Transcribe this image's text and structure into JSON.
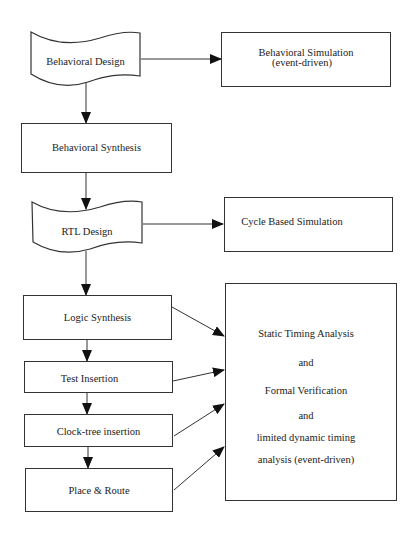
{
  "diagram": {
    "title": "",
    "nodes": [
      {
        "id": "behavioral_design",
        "label": "Behavioral Design",
        "shape": "document"
      },
      {
        "id": "behavioral_simulation",
        "label": "Behavioral Simulation",
        "label2": "(event-driven)",
        "shape": "rect"
      },
      {
        "id": "behavioral_synthesis",
        "label": "Behavioral Synthesis",
        "shape": "rect"
      },
      {
        "id": "rtl_design",
        "label": "RTL Design",
        "shape": "document"
      },
      {
        "id": "cycle_based_simulation",
        "label": "Cycle Based Simulation",
        "shape": "rect"
      },
      {
        "id": "logic_synthesis",
        "label": "Logic Synthesis",
        "shape": "rect"
      },
      {
        "id": "test_insertion",
        "label": "Test Insertion",
        "shape": "rect"
      },
      {
        "id": "clock_tree_insertion",
        "label": "Clock-tree insertion",
        "shape": "rect"
      },
      {
        "id": "place_route",
        "label": "Place & Route",
        "shape": "rect"
      },
      {
        "id": "verification",
        "shape": "rect",
        "lines": [
          "Static Timing Analysis",
          "and",
          "Formal Verification",
          "and",
          "limited dynamic timing",
          "analysis (event-driven)"
        ]
      }
    ],
    "edges": [
      {
        "from": "behavioral_design",
        "to": "behavioral_simulation"
      },
      {
        "from": "behavioral_design",
        "to": "behavioral_synthesis"
      },
      {
        "from": "behavioral_synthesis",
        "to": "rtl_design"
      },
      {
        "from": "rtl_design",
        "to": "cycle_based_simulation"
      },
      {
        "from": "rtl_design",
        "to": "logic_synthesis"
      },
      {
        "from": "logic_synthesis",
        "to": "test_insertion"
      },
      {
        "from": "test_insertion",
        "to": "clock_tree_insertion"
      },
      {
        "from": "clock_tree_insertion",
        "to": "place_route"
      },
      {
        "from": "logic_synthesis",
        "to": "verification"
      },
      {
        "from": "test_insertion",
        "to": "verification"
      },
      {
        "from": "clock_tree_insertion",
        "to": "verification"
      },
      {
        "from": "place_route",
        "to": "verification"
      }
    ]
  },
  "labels": {
    "behavioral_design": "Behavioral Design",
    "behavioral_simulation_1": "Behavioral Simulation",
    "behavioral_simulation_2": "(event-driven)",
    "behavioral_synthesis": "Behavioral Synthesis",
    "rtl_design": "RTL Design",
    "cycle_based_simulation": "Cycle Based Simulation",
    "logic_synthesis": "Logic Synthesis",
    "test_insertion": "Test Insertion",
    "clock_tree_insertion": "Clock-tree insertion",
    "place_route": "Place & Route",
    "verification": [
      "Static Timing Analysis",
      "and",
      "Formal Verification",
      "and",
      "limited dynamic timing",
      "analysis (event-driven)"
    ]
  },
  "colors": {
    "stroke": "#333333",
    "text": "#222222",
    "background": "#ffffff"
  }
}
